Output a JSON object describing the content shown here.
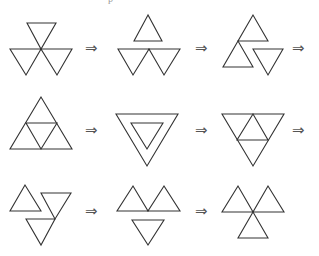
{
  "caption": "p",
  "arrow_glyph": "⇒",
  "stroke_color": "#333333",
  "rows": [
    {
      "figures": [
        {
          "name": "three-inverted-triangles-fan",
          "triangles": [
            [
              [
                27,
                23
              ],
              [
                56,
                23
              ],
              [
                41,
                49
              ]
            ],
            [
              [
                10,
                49
              ],
              [
                41,
                49
              ],
              [
                26,
                75
              ]
            ],
            [
              [
                41,
                49
              ],
              [
                72,
                49
              ],
              [
                57,
                75
              ]
            ]
          ]
        },
        {
          "name": "upright-over-two-inverted",
          "triangles": [
            [
              [
                148,
                15
              ],
              [
                134,
                41
              ],
              [
                162,
                41
              ]
            ],
            [
              [
                118,
                49
              ],
              [
                149,
                49
              ],
              [
                133,
                75
              ]
            ],
            [
              [
                149,
                49
              ],
              [
                180,
                49
              ],
              [
                164,
                75
              ]
            ]
          ]
        },
        {
          "name": "two-upright-one-inverted",
          "triangles": [
            [
              [
                253,
                15
              ],
              [
                238,
                41
              ],
              [
                268,
                41
              ]
            ],
            [
              [
                238,
                41
              ],
              [
                223,
                67
              ],
              [
                253,
                67
              ]
            ],
            [
              [
                253,
                49
              ],
              [
                283,
                49
              ],
              [
                268,
                75
              ]
            ]
          ]
        }
      ],
      "arrows": [
        {
          "x": 85,
          "y": 41
        },
        {
          "x": 195,
          "y": 41
        },
        {
          "x": 292,
          "y": 41
        }
      ]
    },
    {
      "figures": [
        {
          "name": "subdivided-upright-triangle",
          "triangles": [
            [
              [
                41,
                97
              ],
              [
                10,
                149
              ],
              [
                72,
                149
              ]
            ],
            [
              [
                26,
                123
              ],
              [
                57,
                123
              ],
              [
                41,
                149
              ]
            ]
          ]
        },
        {
          "name": "nested-inverted-triangles",
          "triangles": [
            [
              [
                116,
                114
              ],
              [
                178,
                114
              ],
              [
                147,
                166
              ]
            ],
            [
              [
                131,
                123
              ],
              [
                163,
                123
              ],
              [
                147,
                149
              ]
            ]
          ]
        },
        {
          "name": "subdivided-inverted-triangle",
          "triangles": [
            [
              [
                222,
                114
              ],
              [
                284,
                114
              ],
              [
                253,
                166
              ]
            ],
            [
              [
                253,
                114
              ],
              [
                237,
                140
              ],
              [
                268,
                140
              ]
            ]
          ]
        }
      ],
      "arrows": [
        {
          "x": 85,
          "y": 123
        },
        {
          "x": 195,
          "y": 123
        },
        {
          "x": 292,
          "y": 123
        }
      ]
    },
    {
      "figures": [
        {
          "name": "staggered-three-triangles",
          "triangles": [
            [
              [
                25,
                185
              ],
              [
                10,
                211
              ],
              [
                41,
                211
              ]
            ],
            [
              [
                41,
                193
              ],
              [
                71,
                193
              ],
              [
                55,
                219
              ]
            ],
            [
              [
                26,
                219
              ],
              [
                55,
                219
              ],
              [
                41,
                245
              ]
            ]
          ]
        },
        {
          "name": "two-upright-over-inverted",
          "triangles": [
            [
              [
                133,
                186
              ],
              [
                117,
                211
              ],
              [
                148,
                211
              ]
            ],
            [
              [
                164,
                186
              ],
              [
                148,
                211
              ],
              [
                180,
                211
              ]
            ],
            [
              [
                132,
                220
              ],
              [
                164,
                220
              ],
              [
                148,
                245
              ]
            ]
          ]
        },
        {
          "name": "three-upright-triangles-fan",
          "triangles": [
            [
              [
                238,
                186
              ],
              [
                222,
                212
              ],
              [
                253,
                212
              ]
            ],
            [
              [
                268,
                186
              ],
              [
                253,
                212
              ],
              [
                284,
                212
              ]
            ],
            [
              [
                253,
                212
              ],
              [
                238,
                238
              ],
              [
                268,
                238
              ]
            ]
          ]
        }
      ],
      "arrows": [
        {
          "x": 85,
          "y": 204
        },
        {
          "x": 195,
          "y": 204
        }
      ]
    }
  ]
}
